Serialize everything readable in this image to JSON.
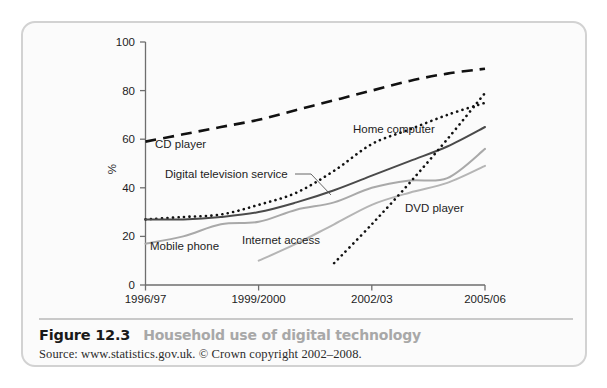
{
  "figure": {
    "number": "Figure 12.3",
    "title": "Household use of digital technology",
    "source": "Source: www.statistics.gov.uk. © Crown copyright 2002–2008."
  },
  "chart_data": {
    "type": "line",
    "title": "Household use of digital technology",
    "xlabel": "",
    "ylabel": "%",
    "ylim": [
      0,
      100
    ],
    "yticks": [
      0,
      20,
      40,
      60,
      80,
      100
    ],
    "x": [
      "1996/97",
      "1997/98",
      "1998/99",
      "1999/2000",
      "2000/01",
      "2001/02",
      "2002/03",
      "2003/04",
      "2004/05",
      "2005/06"
    ],
    "xtick_labels": [
      "1996/97",
      "1999/2000",
      "2002/03",
      "2005/06"
    ],
    "xtick_positions": [
      0,
      3,
      6,
      9
    ],
    "grid": false,
    "legend": "inline-labels",
    "series": [
      {
        "name": "CD player",
        "style": "dashed",
        "color": "#111111",
        "values": [
          59,
          62,
          65,
          68,
          72,
          76,
          80,
          84,
          87,
          89
        ]
      },
      {
        "name": "Home computer",
        "style": "dotted",
        "color": "#111111",
        "values": [
          27,
          28,
          29,
          33,
          38,
          47,
          58,
          64,
          70,
          75
        ]
      },
      {
        "name": "Digital television service",
        "style": "solid",
        "color": "#4a4a4a",
        "values": [
          27,
          27,
          28,
          30,
          34,
          39,
          45,
          51,
          57,
          65
        ]
      },
      {
        "name": "Internet access",
        "style": "solid",
        "color": "#a9a9a9",
        "values": [
          17,
          20,
          25,
          26,
          31,
          34,
          40,
          43,
          44,
          56
        ]
      },
      {
        "name": "Mobile phone",
        "style": "solid-light",
        "color": "#b5b5b5",
        "values": [
          null,
          null,
          null,
          10,
          17,
          25,
          33,
          38,
          42,
          49
        ]
      },
      {
        "name": "DVD player",
        "style": "dotted",
        "color": "#111111",
        "values": [
          null,
          null,
          null,
          null,
          null,
          9,
          25,
          42,
          60,
          79
        ]
      }
    ]
  },
  "labels": {
    "cd_player": "CD player",
    "home_computer": "Home computer",
    "digital_tv": "Digital television service",
    "internet_access": "Internet access",
    "mobile_phone": "Mobile phone",
    "dvd_player": "DVD player",
    "y_axis": "%",
    "y_100": "100",
    "y_80": "80",
    "y_60": "60",
    "y_40": "40",
    "y_20": "20",
    "y_0": "0",
    "x_1": "1996/97",
    "x_2": "1999/2000",
    "x_3": "2002/03",
    "x_4": "2005/06"
  }
}
